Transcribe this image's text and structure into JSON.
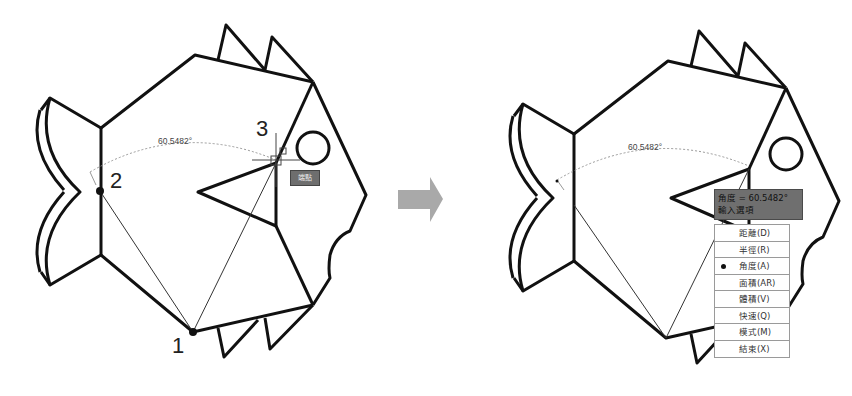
{
  "left_panel": {
    "angle_label": "60.5482°",
    "points": [
      {
        "label": "1"
      },
      {
        "label": "2"
      },
      {
        "label": "3"
      }
    ],
    "snap_tooltip": "端點"
  },
  "transition_arrow": {
    "icon": "right-arrow-icon",
    "color": "#a9a9a9"
  },
  "right_panel": {
    "angle_label": "60.5482°",
    "dynamic_tooltip": {
      "line1": "角度 = 60.5482°",
      "line2": "輸入選項"
    },
    "options_menu": {
      "items": [
        {
          "label": "距離(D)",
          "selected": false
        },
        {
          "label": "半徑(R)",
          "selected": false
        },
        {
          "label": "角度(A)",
          "selected": true
        },
        {
          "label": "面積(AR)",
          "selected": false
        },
        {
          "label": "體積(V)",
          "selected": false
        },
        {
          "label": "快速(Q)",
          "selected": false
        },
        {
          "label": "模式(M)",
          "selected": false
        },
        {
          "label": "結束(X)",
          "selected": false
        }
      ]
    }
  },
  "colors": {
    "outline": "#111111",
    "tooltip_bg": "#6f6f6f",
    "menu_border": "#9a9a9a",
    "dotted_arc": "#9a9a9a"
  }
}
